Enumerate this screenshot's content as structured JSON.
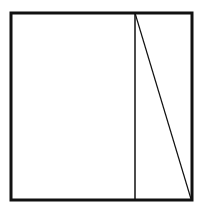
{
  "diagram": {
    "type": "geometric-figure",
    "stroke_color": "#111111",
    "background": "#ffffff",
    "outer_square": {
      "x1": 11,
      "y1": 13,
      "x2": 192,
      "y2": 200,
      "stroke_width": 3
    },
    "vertical_line": {
      "x": 135,
      "y1": 13,
      "y2": 200,
      "stroke_width": 1.5
    },
    "diagonal_line": {
      "x1": 135,
      "y1": 13,
      "x2": 191,
      "y2": 199,
      "stroke_width": 1.2
    }
  }
}
